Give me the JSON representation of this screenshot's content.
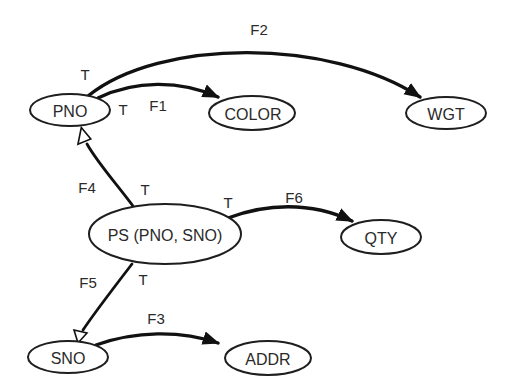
{
  "diagram": {
    "type": "functional-dependency-graph",
    "colors": {
      "stroke": "#111111",
      "text": "#2a2a2a",
      "background": "#ffffff"
    },
    "nodes": {
      "pno": {
        "label": "PNO"
      },
      "color": {
        "label": "COLOR"
      },
      "wgt": {
        "label": "WGT"
      },
      "ps": {
        "label": "PS (PNO, SNO)"
      },
      "qty": {
        "label": "QTY"
      },
      "sno": {
        "label": "SNO"
      },
      "addr": {
        "label": "ADDR"
      }
    },
    "edges": {
      "f1": {
        "label": "F1",
        "from": "PNO",
        "to": "COLOR",
        "tail_marker": "T",
        "arrow": "filled"
      },
      "f2": {
        "label": "F2",
        "from": "PNO",
        "to": "WGT",
        "tail_marker": "T",
        "arrow": "filled"
      },
      "f3": {
        "label": "F3",
        "from": "SNO",
        "to": "ADDR",
        "arrow": "filled"
      },
      "f4": {
        "label": "F4",
        "from": "PS (PNO, SNO)",
        "to": "PNO",
        "tail_marker": "T",
        "arrow": "hollow"
      },
      "f5": {
        "label": "F5",
        "from": "PS (PNO, SNO)",
        "to": "SNO",
        "tail_marker": "T",
        "arrow": "hollow"
      },
      "f6": {
        "label": "F6",
        "from": "PS (PNO, SNO)",
        "to": "QTY",
        "tail_marker": "T",
        "arrow": "filled"
      }
    }
  }
}
